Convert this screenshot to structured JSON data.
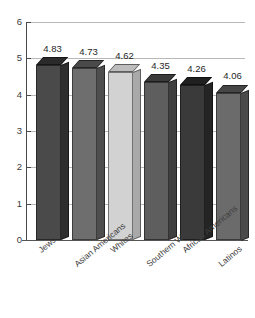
{
  "chart_data": {
    "type": "bar",
    "title": "",
    "subtitle": "",
    "xlabel": "",
    "ylabel": "",
    "categories": [
      "Jews",
      "Asian Americans",
      "Whites",
      "Southern Whites",
      "African Americans",
      "Latinos"
    ],
    "values": [
      4.83,
      4.73,
      4.62,
      4.35,
      4.26,
      4.06
    ],
    "value_labels": [
      "4.83",
      "4.73",
      "4.62",
      "4.35",
      "4.26",
      "4.06"
    ],
    "ylim": [
      0,
      6
    ],
    "yticks": [
      0,
      1,
      2,
      3,
      4,
      5,
      6
    ],
    "ytick_labels": [
      "0",
      "1",
      "2",
      "3",
      "4",
      "5",
      "6"
    ],
    "grid": true,
    "grid_axis": "y",
    "legend": false,
    "legend_position": "none",
    "style": "3d-bar-grayscale",
    "bar_colors": [
      "#4a4a4a",
      "#6e6e6e",
      "#d2d2d2",
      "#5e5e5e",
      "#3a3a3a",
      "#6b6b6b"
    ],
    "bar_side_colors": [
      "#2e2e2e",
      "#4e4e4e",
      "#a9a9a9",
      "#3f3f3f",
      "#242424",
      "#4a4a4a"
    ],
    "bar_top_colors": [
      "#2a2a2a",
      "#4a4a4a",
      "#bdbdbd",
      "#3a3a3a",
      "#202020",
      "#464646"
    ],
    "axis_color": "#4a4a4a",
    "grid_color": "#b8b8b8",
    "background": "#ffffff"
  }
}
